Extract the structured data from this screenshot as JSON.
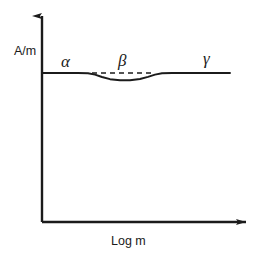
{
  "figure": {
    "background_color": "#ffffff",
    "ink_color": "#1b1b1b"
  },
  "axes": {
    "y_label": "A/m",
    "x_label": "Log m",
    "y_axis_name": "vertical-axis-arrow",
    "x_axis_name": "horizontal-axis-arrow",
    "origin": {
      "x": 42,
      "y": 222
    },
    "y_axis_top": {
      "x": 42,
      "y": 12
    },
    "x_axis_right": {
      "x": 253,
      "y": 222
    },
    "ticks": [],
    "grid": false
  },
  "region_labels": [
    {
      "id": "alpha",
      "text": "α",
      "x": 61,
      "y": 67
    },
    {
      "id": "beta",
      "text": "β",
      "x": 118,
      "y": 66
    },
    {
      "id": "gamma",
      "text": "γ",
      "x": 203,
      "y": 64
    }
  ],
  "chart_data": {
    "type": "line",
    "title": "",
    "xlabel": "Log m",
    "ylabel": "A/m",
    "xlim": [
      42,
      253
    ],
    "ylim": [
      222,
      12
    ],
    "grid": false,
    "legend": "none",
    "annotations": [
      "α",
      "β",
      "γ"
    ],
    "series": [
      {
        "name": "magnetization-curve",
        "style": "solid",
        "stroke": "#1b1b1b",
        "stroke_width": 1.9,
        "points": [
          [
            42,
            73.0
          ],
          [
            60,
            73.0
          ],
          [
            78,
            73.0
          ],
          [
            88,
            73.2
          ],
          [
            95,
            74.6
          ],
          [
            102,
            77.0
          ],
          [
            110,
            79.2
          ],
          [
            120,
            80.2
          ],
          [
            130,
            80.2
          ],
          [
            140,
            79.0
          ],
          [
            148,
            76.8
          ],
          [
            155,
            74.6
          ],
          [
            162,
            73.2
          ],
          [
            172,
            73.0
          ],
          [
            190,
            73.0
          ],
          [
            210,
            73.0
          ],
          [
            230,
            73.0
          ]
        ]
      },
      {
        "name": "reference-dashed-line",
        "style": "dashed",
        "stroke": "#1b1b1b",
        "stroke_width": 1.6,
        "dash_pattern": "5,4",
        "points": [
          [
            92,
            73.0
          ],
          [
            152,
            73.0
          ]
        ]
      }
    ]
  }
}
